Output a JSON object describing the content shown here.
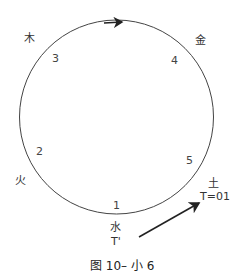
{
  "diagram": {
    "elements": {
      "wood": "木",
      "metal": "金",
      "fire": "火",
      "earth": "土",
      "water": "水"
    },
    "numbers": {
      "n1": "1",
      "n2": "2",
      "n3": "3",
      "n4": "4",
      "n5": "5"
    },
    "earth_time": "T=01",
    "water_time": "T'",
    "circle_direction": "clockwise",
    "colors": {
      "stroke": "#333333",
      "text": "#333333"
    }
  },
  "caption": "图 10– 小 6"
}
